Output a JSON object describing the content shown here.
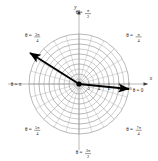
{
  "chart_data": {
    "type": "line",
    "title": "",
    "subtitle": "",
    "coordinate_system": "polar",
    "grid": true,
    "legend": null,
    "center_px": [
      79,
      84
    ],
    "radius_px": 50,
    "axes": {
      "x_axis_label": "x",
      "y_axis_label": "y",
      "radial_ticks": [
        2,
        4,
        6,
        8,
        10
      ],
      "radial_range": [
        0,
        10
      ],
      "angular_divisions": 24
    },
    "angular_labels": [
      {
        "id": "theta-0",
        "text": "θ = 0",
        "angle_deg": 0,
        "theta_num": "",
        "theta_den": ""
      },
      {
        "id": "theta-pi-4",
        "text": "θ =",
        "angle_deg": 45,
        "theta_num": "π",
        "theta_den": "4"
      },
      {
        "id": "theta-pi-2",
        "text": "θ =",
        "angle_deg": 90,
        "theta_num": "π",
        "theta_den": "2"
      },
      {
        "id": "theta-3pi-4",
        "text": "θ =",
        "angle_deg": 135,
        "theta_num": "3π",
        "theta_den": "4"
      },
      {
        "id": "theta-pi",
        "text": "θ = π",
        "angle_deg": 180,
        "theta_num": "",
        "theta_den": ""
      },
      {
        "id": "theta-5pi-4",
        "text": "θ =",
        "angle_deg": 225,
        "theta_num": "5π",
        "theta_den": "4"
      },
      {
        "id": "theta-3pi-2",
        "text": "θ =",
        "angle_deg": 270,
        "theta_num": "3π",
        "theta_den": "2"
      },
      {
        "id": "theta-7pi-4",
        "text": "θ =",
        "angle_deg": 315,
        "theta_num": "7π",
        "theta_den": "4"
      }
    ],
    "vectors": [
      {
        "name": "vector-upper-left",
        "from_px": [
          79,
          84
        ],
        "to_px": [
          30,
          53
        ],
        "r": 11.6,
        "theta_deg": 148,
        "color": "#000000"
      },
      {
        "name": "vector-lower-right",
        "from_px": [
          79,
          84
        ],
        "to_px": [
          129,
          89
        ],
        "r": 10.0,
        "theta_deg": -6,
        "color": "#000000"
      }
    ],
    "colors": {
      "grid": "#8c8c8c",
      "grid_light": "#a8a8a8",
      "axis": "#6e6e6e",
      "vector": "#000000",
      "origin_dot": "#000000",
      "text": "#1a1a1a",
      "background": "#ffffff"
    },
    "tick_labels_text": {
      "t2": "2",
      "t4": "4",
      "t6": "6",
      "t8": "8",
      "t10": "10"
    },
    "origin_marker": {
      "shape": "dot",
      "radius_px": 2.6
    }
  }
}
